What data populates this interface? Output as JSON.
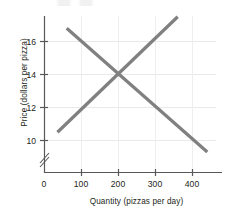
{
  "chart_data": {
    "type": "line",
    "title": "",
    "xlabel": "Quantity (pizzas per day)",
    "ylabel": "Price (dollars per pizza)",
    "xlim": [
      0,
      470
    ],
    "ylim": [
      9,
      17.8
    ],
    "xticks": [
      0,
      100,
      200,
      300,
      400
    ],
    "xtick_labels": [
      "0",
      "100",
      "200",
      "300",
      "400"
    ],
    "yticks": [
      10,
      12,
      14,
      16
    ],
    "ytick_labels": [
      "10",
      "12",
      "14",
      "16"
    ],
    "grid": true,
    "legend": "none",
    "y_axis_break": true,
    "series": [
      {
        "name": "demand",
        "direction": "downward-sloping",
        "color": "#808080",
        "points": [
          {
            "x": 60,
            "y": 16.8
          },
          {
            "x": 440,
            "y": 9.3
          }
        ]
      },
      {
        "name": "supply",
        "direction": "upward-sloping",
        "color": "#808080",
        "points": [
          {
            "x": 35,
            "y": 10.5
          },
          {
            "x": 360,
            "y": 17.5
          }
        ]
      }
    ],
    "equilibrium": {
      "x": 200,
      "y": 14
    }
  },
  "axes": {
    "y_title": "Price (dollars per pizza)",
    "x_title": "Quantity (pizzas per day)",
    "y_tick_0": "16",
    "y_tick_1": "14",
    "y_tick_2": "12",
    "y_tick_3": "10",
    "x_tick_0": "0",
    "x_tick_1": "100",
    "x_tick_2": "200",
    "x_tick_3": "300",
    "x_tick_4": "400"
  },
  "colors": {
    "line": "#808080",
    "axis": "#58585a",
    "grid": "#e8e8ea",
    "text": "#231f20"
  }
}
